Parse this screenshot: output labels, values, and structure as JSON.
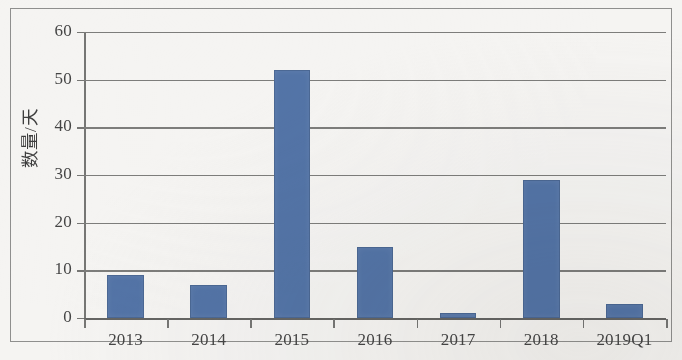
{
  "chart_data": {
    "type": "bar",
    "title": "",
    "xlabel": "",
    "ylabel": "数量/天",
    "categories": [
      "2013",
      "2014",
      "2015",
      "2016",
      "2017",
      "2018",
      "2019Q1"
    ],
    "values": [
      9,
      7,
      52,
      15,
      1,
      29,
      3
    ],
    "series": [
      {
        "name": "数量/天",
        "values": [
          9,
          7,
          52,
          15,
          1,
          29,
          3
        ]
      }
    ],
    "ylim": [
      0,
      60
    ],
    "ytick_labels": [
      "0",
      "10",
      "20",
      "30",
      "40",
      "50",
      "60"
    ],
    "ytick_values": [
      0,
      10,
      20,
      30,
      40,
      50,
      60
    ],
    "grid": "horizontal",
    "legend": "none",
    "bar_color": "#4a6da3",
    "axis_color": "#6f6f6d",
    "background_color": "#f6f5f3"
  }
}
